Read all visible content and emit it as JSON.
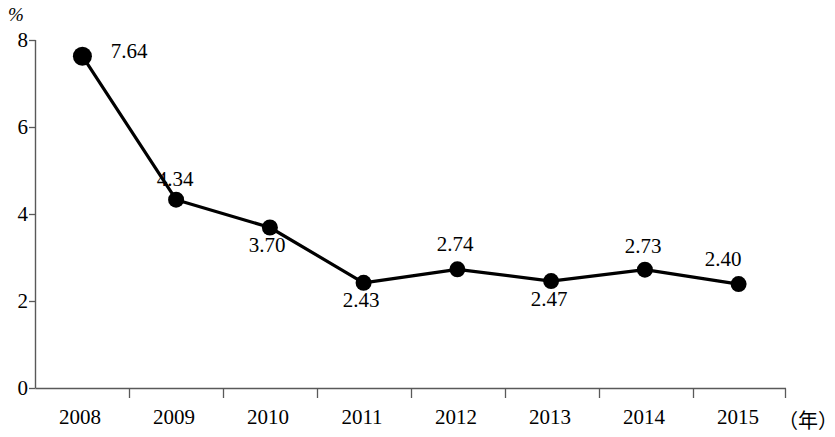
{
  "chart_data": {
    "type": "line",
    "title": "",
    "subtitle": "",
    "xlabel": "（年）",
    "ylabel": "%",
    "categories": [
      "2008",
      "2009",
      "2010",
      "2011",
      "2012",
      "2013",
      "2014",
      "2015"
    ],
    "values": [
      7.64,
      4.34,
      3.7,
      2.43,
      2.74,
      2.47,
      2.73,
      2.4
    ],
    "point_labels": [
      "7.64",
      "4.34",
      "3.70",
      "2.43",
      "2.74",
      "2.47",
      "2.73",
      "2.40"
    ],
    "label_positions": [
      "right",
      "above",
      "below",
      "below",
      "above",
      "below",
      "above",
      "above-left"
    ],
    "ylim": [
      0,
      8
    ],
    "yticks": [
      0,
      2,
      4,
      6,
      8
    ],
    "ytick_labels": [
      "0",
      "2",
      "4",
      "6",
      "8"
    ],
    "grid": false,
    "legend": null,
    "series": [
      {
        "name": "",
        "values": [
          7.64,
          4.34,
          3.7,
          2.43,
          2.74,
          2.47,
          2.73,
          2.4
        ],
        "marker": "circle",
        "color": "#000000"
      }
    ],
    "colors": {
      "line": "#000000",
      "marker": "#000000",
      "axis": "#595959",
      "text": "#000000",
      "background": "#ffffff"
    }
  }
}
